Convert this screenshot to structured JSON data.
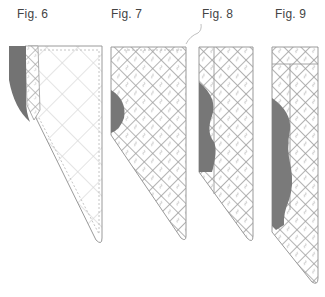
{
  "figures": [
    {
      "label": "Fig. 6",
      "x": 17,
      "y": 8
    },
    {
      "label": "Fig. 7",
      "x": 111,
      "y": 8
    },
    {
      "label": "Fig. 8",
      "x": 202,
      "y": 8
    },
    {
      "label": "Fig. 9",
      "x": 275,
      "y": 8
    }
  ],
  "colors": {
    "outline": "#9a9a9a",
    "quilt_line": "#a8a8a8",
    "quilt_line_light": "#d6d6d6",
    "dark_insert": "#777777",
    "background": "#ffffff"
  }
}
